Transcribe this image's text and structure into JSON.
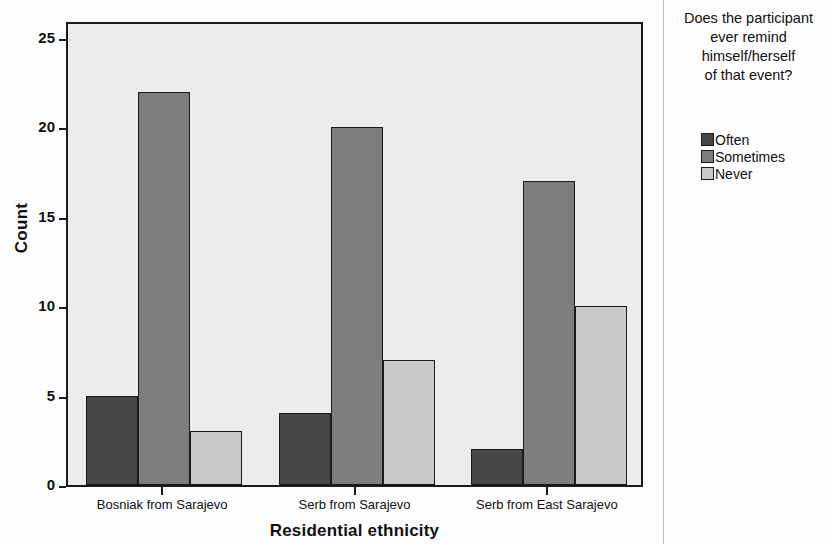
{
  "chart_data": {
    "type": "bar",
    "title": "",
    "xlabel": "Residential ethnicity",
    "ylabel": "Count",
    "categories": [
      "Bosniak from Sarajevo",
      "Serb from Sarajevo",
      "Serb from East Sarajevo"
    ],
    "series": [
      {
        "name": "Often",
        "color": "#454545",
        "values": [
          5,
          4,
          2
        ]
      },
      {
        "name": "Sometimes",
        "color": "#7d7d7d",
        "values": [
          22,
          20,
          17
        ]
      },
      {
        "name": "Never",
        "color": "#c9c9c9",
        "values": [
          3,
          7,
          10
        ]
      }
    ],
    "ylim": [
      0,
      26
    ],
    "yticks": [
      0,
      5,
      10,
      15,
      20,
      25
    ],
    "ytick_labels": [
      "0",
      "5",
      "10",
      "15",
      "20",
      "25"
    ],
    "grid": false,
    "legend_position": "right",
    "legend_title": "Does the participant ever remind himself/herself of that event?",
    "legend_title_lines": [
      "Does the participant",
      "ever remind",
      "himself/herself",
      "of that event?"
    ],
    "plot_background": "#ececec",
    "axis_color": "#1a1a1a"
  }
}
